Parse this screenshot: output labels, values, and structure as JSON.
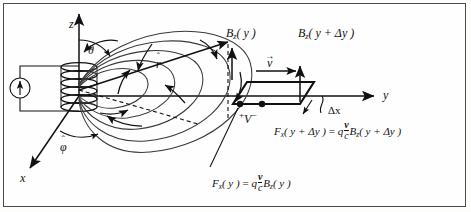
{
  "figure": {
    "background_color": "#fefefe",
    "border_color": "#4a4a4a",
    "ink_color": "#111111"
  },
  "axes": {
    "z_label": "z",
    "y_label": "y",
    "x_label": "x"
  },
  "unit_vectors": {
    "r_hat": "r",
    "r_hat_accent": "ˆ",
    "phi_hat": "φ",
    "phi_hat_accent": "ˆ",
    "theta": "θ"
  },
  "source": {
    "name": "current-source",
    "symbol": "↑"
  },
  "loop": {
    "velocity_label": "v",
    "velocity_accent": "→",
    "delta_x_label": "Δx",
    "terminal_plus": "+",
    "terminal_voltage": "V",
    "terminal_minus": "−"
  },
  "field_labels": {
    "b_left_main": "B",
    "b_left_sub": "z",
    "b_left_arg": "( y )",
    "b_right_main": "B",
    "b_right_sub": "z",
    "b_right_arg": "( y + Δy )"
  },
  "equations": {
    "force_y": {
      "lhs_f": "F",
      "lhs_sub": "x",
      "lhs_arg": "( y )",
      "equals": "=",
      "charge": "q",
      "frac_num": "v",
      "frac_den": "c",
      "b_main": "B",
      "b_sub": "z",
      "b_arg": "( y )"
    },
    "force_y_plus_dy": {
      "lhs_f": "F",
      "lhs_sub": "x",
      "lhs_arg": "( y + Δy )",
      "equals": "=",
      "charge": "q",
      "frac_num": "v",
      "frac_den": "c",
      "b_main": "B",
      "b_sub": "z",
      "b_arg": "( y + Δy )"
    }
  }
}
